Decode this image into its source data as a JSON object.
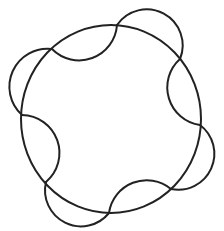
{
  "figure": {
    "description": "Circle with alternating inward and outward arc scallops",
    "stroke_color": "#222222",
    "background_color": "#ffffff",
    "base_circle": {
      "cx": 111,
      "cy": 119,
      "rx": 90,
      "ry": 94
    },
    "intersection_points": [
      [
        52,
        49
      ],
      [
        117,
        25
      ],
      [
        180,
        59
      ],
      [
        200,
        125
      ],
      [
        171,
        189
      ],
      [
        109,
        213
      ],
      [
        46,
        182
      ],
      [
        22,
        115
      ]
    ],
    "arcs": [
      {
        "from": [
          52,
          49
        ],
        "to": [
          117,
          25
        ],
        "direction": "inward"
      },
      {
        "from": [
          117,
          25
        ],
        "to": [
          180,
          59
        ],
        "direction": "outward"
      },
      {
        "from": [
          180,
          59
        ],
        "to": [
          200,
          125
        ],
        "direction": "inward"
      },
      {
        "from": [
          200,
          125
        ],
        "to": [
          171,
          189
        ],
        "direction": "outward"
      },
      {
        "from": [
          171,
          189
        ],
        "to": [
          109,
          213
        ],
        "direction": "inward"
      },
      {
        "from": [
          109,
          213
        ],
        "to": [
          46,
          182
        ],
        "direction": "outward"
      },
      {
        "from": [
          46,
          182
        ],
        "to": [
          22,
          115
        ],
        "direction": "inward"
      },
      {
        "from": [
          22,
          115
        ],
        "to": [
          52,
          49
        ],
        "direction": "outward"
      }
    ]
  }
}
